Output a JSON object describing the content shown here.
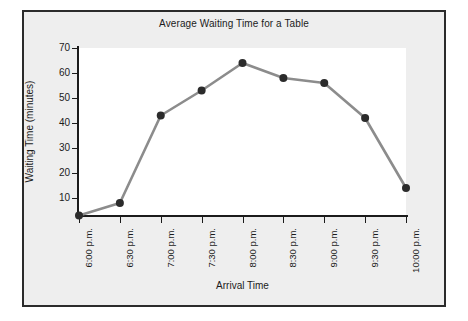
{
  "chart_data": {
    "type": "line",
    "title": "Average Waiting Time for a Table",
    "xlabel": "Arrival Time",
    "ylabel": "Waiting Time (minutes)",
    "categories": [
      "6:00 p.m.",
      "6:30 p.m.",
      "7:00 p.m.",
      "7:30 p.m.",
      "8:00 p.m.",
      "8:30 p.m.",
      "9:00 p.m.",
      "9:30 p.m.",
      "10:00 p.m."
    ],
    "values": [
      3,
      8,
      43,
      53,
      64,
      58,
      56,
      42,
      14
    ],
    "yticks": [
      10,
      20,
      30,
      40,
      50,
      60,
      70
    ],
    "ylim": [
      0,
      70
    ],
    "grid": false,
    "legend": false,
    "legend_position": "none",
    "marker": "circle",
    "line_color": "#8c8c8c",
    "marker_color": "#2b2b2b",
    "axis_color": "#1b1b1b",
    "panel_background": "#eeeeee",
    "plot_background": "#ffffff"
  }
}
